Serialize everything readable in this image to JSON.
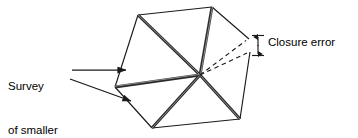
{
  "diagram": {
    "type": "technical-line-diagram",
    "colors": {
      "stroke": "#1a1a1a",
      "background": "#ffffff"
    },
    "labels": {
      "survey_of_smaller_areas": {
        "line1": "Survey",
        "line2": "of smaller",
        "line3": "areas"
      },
      "closure_error": "Closure error"
    },
    "icons": {
      "dimension_marker": "vertical-double-arrow-icon",
      "leader_arrow": "arrowhead-icon"
    },
    "geometry": {
      "center": [
        200,
        75
      ],
      "hexagon_vertices": [
        [
          138,
          15
        ],
        [
          212,
          7
        ],
        [
          252,
          41
        ],
        [
          240,
          119
        ],
        [
          152,
          128
        ],
        [
          115,
          87
        ]
      ],
      "closure_gap": {
        "point_a": [
          249,
          39
        ],
        "point_b": [
          250,
          52
        ],
        "magnitude_label": "Closure error"
      },
      "dashed_rays": 2,
      "radial_spokes": 6
    }
  }
}
